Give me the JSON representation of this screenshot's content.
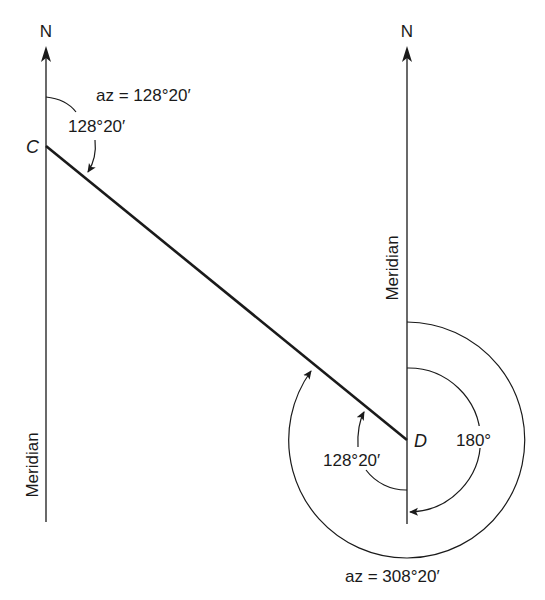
{
  "diagram": {
    "left_meridian": {
      "north_label": "N",
      "meridian_label": "Meridian"
    },
    "right_meridian": {
      "north_label": "N",
      "meridian_label": "Meridian"
    },
    "points": {
      "c": "C",
      "d": "D"
    },
    "forward": {
      "az_label": "az = 128°20′",
      "angle_label": "128°20′"
    },
    "back": {
      "angle_label": "128°20′",
      "half_turn_label": "180°",
      "az_label": "az = 308°20′"
    },
    "colors": {
      "ink": "#1a1a1a",
      "background": "#ffffff"
    }
  }
}
